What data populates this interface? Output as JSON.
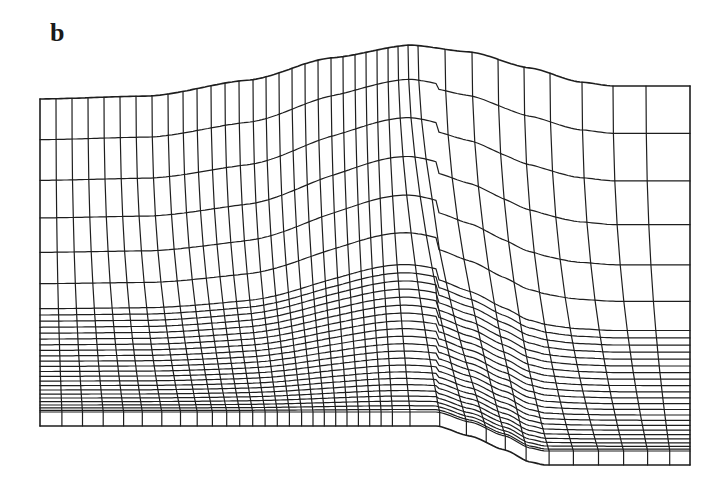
{
  "figure": {
    "panel_label": "b",
    "stroke_color": "#1e1e1e",
    "background_color": "#ffffff"
  },
  "mesh": {
    "columns": 46,
    "rows": 30,
    "left_x": 40,
    "right_x": 690,
    "top_boundary_points": [
      [
        40,
        99
      ],
      [
        150,
        96
      ],
      [
        250,
        80
      ],
      [
        330,
        58
      ],
      [
        410,
        45
      ],
      [
        470,
        52
      ],
      [
        530,
        68
      ],
      [
        580,
        82
      ],
      [
        613,
        86
      ],
      [
        690,
        86
      ]
    ],
    "bottom_boundary_points": [
      [
        40,
        426
      ],
      [
        437,
        426
      ],
      [
        470,
        436
      ],
      [
        505,
        450
      ],
      [
        530,
        462
      ],
      [
        545,
        465
      ],
      [
        690,
        465
      ]
    ],
    "column_x_top": [
      40,
      56,
      72,
      88,
      104,
      120,
      136,
      152,
      168,
      183,
      197,
      211,
      225,
      239,
      253,
      266,
      279,
      292,
      305,
      318,
      331,
      343,
      355,
      366,
      377,
      388,
      398,
      408,
      418,
      445,
      472,
      498,
      524,
      550,
      582,
      613,
      646,
      690
    ],
    "column_x_bottom": [
      40,
      67,
      92,
      118,
      141,
      165,
      188,
      207,
      225,
      241,
      257,
      272,
      287,
      302,
      316,
      330,
      344,
      358,
      372,
      386,
      400,
      437,
      470,
      493,
      517,
      545,
      575,
      606,
      637,
      665,
      690
    ],
    "row_fractions_top_band": [
      0,
      0.13,
      0.26,
      0.38,
      0.49,
      0.59,
      0.67
    ],
    "row_fractions_bottom_band_count": 22,
    "boundary_layer_row_height_px": 14
  }
}
